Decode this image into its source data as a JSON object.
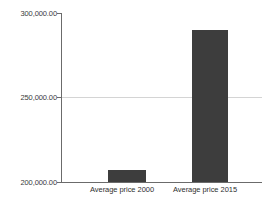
{
  "chart_data": {
    "type": "bar",
    "title": "",
    "subtitle": "",
    "xlabel": "",
    "ylabel": "",
    "categories": [
      "Average price 2000",
      "Average price 2015"
    ],
    "values": [
      207000,
      290000
    ],
    "series": [
      {
        "name": "Average price",
        "values": [
          207000,
          290000
        ]
      }
    ],
    "ylim": [
      200000,
      300000
    ],
    "y_ticks": [
      200000,
      250000,
      300000
    ],
    "y_tick_labels": [
      "200,000.00",
      "250,000.00",
      "300,000.00"
    ],
    "grid": true,
    "grid_axis": "y",
    "legend": false,
    "legend_position": "none",
    "bar_color": "#3d3d3d",
    "axis_color": "#6b6b6b",
    "gridline_color": "#d4d4d4",
    "background": "#ffffff"
  },
  "axis": {
    "y_labels": {
      "top": "300,000.00",
      "middle": "250,000.00",
      "bottom": "200,000.00"
    },
    "x_labels": {
      "first": "Average price 2000",
      "second": "Average price 2015"
    }
  }
}
